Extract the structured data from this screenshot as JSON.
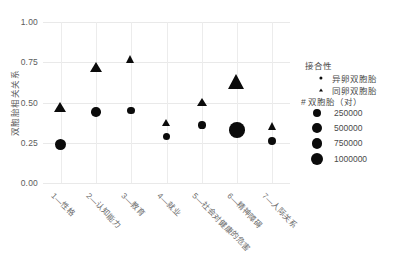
{
  "chart_data": {
    "type": "scatter",
    "title": "",
    "xlabel": "",
    "ylabel": "双胞胎相关关系",
    "ylim": [
      0.0,
      1.0
    ],
    "yticks": [
      "0.00",
      "0.25",
      "0.50",
      "0.75",
      "1.00"
    ],
    "ytick_values": [
      0.0,
      0.25,
      0.5,
      0.75,
      1.0
    ],
    "grid": true,
    "legend_position": "right",
    "categories": [
      "1—性格",
      "2—认知能力",
      "3—教育",
      "4—就业",
      "5—社会对健康的危害",
      "6—精神障碍",
      "7—人际关系"
    ],
    "series": [
      {
        "name": "异卵双胞胎",
        "marker": "circle",
        "values": [
          0.24,
          0.44,
          0.45,
          0.29,
          0.36,
          0.33,
          0.26
        ],
        "sizes": [
          340000,
          210000,
          90000,
          60000,
          95000,
          1000000,
          105000
        ]
      },
      {
        "name": "同卵双胞胎",
        "marker": "triangle",
        "values": [
          0.47,
          0.72,
          0.77,
          0.37,
          0.5,
          0.63,
          0.35
        ],
        "sizes": [
          330000,
          300000,
          135000,
          105000,
          150000,
          960000,
          130000
        ]
      }
    ]
  },
  "legend": {
    "zygosity_title": "接合性",
    "items": [
      {
        "label": "异卵双胞胎",
        "marker": "circle"
      },
      {
        "label": "同卵双胞胎",
        "marker": "triangle"
      }
    ],
    "size_title": "# 双胞胎（对）",
    "size_items": [
      {
        "label": "250000",
        "value": 250000
      },
      {
        "label": "500000",
        "value": 500000
      },
      {
        "label": "750000",
        "value": 750000
      },
      {
        "label": "1000000",
        "value": 1000000
      }
    ]
  },
  "axis": {
    "y_label": "双胞胎相关关系",
    "y_tick_0": "0.00",
    "y_tick_1": "0.25",
    "y_tick_2": "0.50",
    "y_tick_3": "0.75",
    "y_tick_4": "1.00"
  }
}
